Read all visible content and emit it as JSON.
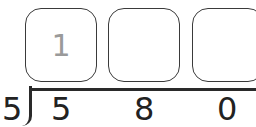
{
  "quotient_boxes": [
    {
      "value": "1"
    },
    {
      "value": ""
    },
    {
      "value": ""
    }
  ],
  "divisor": "5",
  "dividend_digits": [
    "5",
    "8",
    "0"
  ]
}
